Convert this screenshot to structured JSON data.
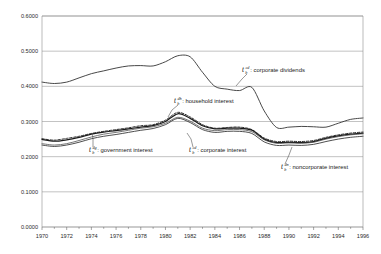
{
  "chart_data": {
    "type": "line",
    "title": "",
    "subtitle": "",
    "xlabel": "",
    "ylabel": "",
    "xlim": [
      1970,
      1996
    ],
    "ylim": [
      0.0,
      0.6
    ],
    "grid": true,
    "grid_axis": "y",
    "legend": "inline-annotations",
    "legend_position": "inside-plot",
    "x": [
      1970,
      1971,
      1972,
      1973,
      1974,
      1975,
      1976,
      1977,
      1978,
      1979,
      1980,
      1981,
      1982,
      1983,
      1984,
      1985,
      1986,
      1987,
      1988,
      1989,
      1990,
      1991,
      1992,
      1993,
      1994,
      1995,
      1996
    ],
    "y_ticks": [
      0.0,
      0.1,
      0.2,
      0.3,
      0.4,
      0.5,
      0.6
    ],
    "y_tick_labels": [
      "0.0000",
      "0.1000",
      "0.2000",
      "0.3000",
      "0.4000",
      "0.5000",
      "0.6000"
    ],
    "x_ticks": [
      1970,
      1972,
      1974,
      1976,
      1978,
      1980,
      1982,
      1984,
      1986,
      1988,
      1990,
      1992,
      1994,
      1996
    ],
    "x_tick_labels": [
      "1970",
      "1972",
      "1974",
      "1976",
      "1978",
      "1980",
      "1982",
      "1984",
      "1986",
      "1988",
      "1990",
      "1992",
      "1994",
      "1996"
    ],
    "series": [
      {
        "name": "corporate dividends",
        "symbol_base": "t",
        "symbol_sub": "b",
        "symbol_sup": "cd",
        "style": "solid",
        "color": "#333333",
        "width": 0.9,
        "values": [
          0.412,
          0.408,
          0.412,
          0.424,
          0.436,
          0.444,
          0.452,
          0.458,
          0.459,
          0.458,
          0.47,
          0.487,
          0.484,
          0.44,
          0.4,
          0.392,
          0.388,
          0.397,
          0.33,
          0.283,
          0.284,
          0.286,
          0.285,
          0.284,
          0.295,
          0.306,
          0.31
        ]
      },
      {
        "name": "household interest",
        "symbol_base": "t",
        "symbol_sub": "b",
        "symbol_sup": "dh",
        "style": "dashed",
        "color": "#1a1a1a",
        "width": 0.9,
        "values": [
          0.251,
          0.247,
          0.252,
          0.258,
          0.266,
          0.272,
          0.277,
          0.282,
          0.288,
          0.291,
          0.304,
          0.326,
          0.313,
          0.291,
          0.281,
          0.283,
          0.284,
          0.277,
          0.253,
          0.243,
          0.244,
          0.243,
          0.246,
          0.255,
          0.262,
          0.267,
          0.27
        ]
      },
      {
        "name": "corporate interest",
        "symbol_base": "t",
        "symbol_sub": "b",
        "symbol_sup": "cd",
        "style": "solid",
        "color": "#1a1a1a",
        "width": 1.25,
        "values": [
          0.249,
          0.244,
          0.248,
          0.255,
          0.264,
          0.27,
          0.274,
          0.279,
          0.284,
          0.288,
          0.3,
          0.322,
          0.309,
          0.288,
          0.279,
          0.281,
          0.281,
          0.275,
          0.25,
          0.24,
          0.241,
          0.24,
          0.243,
          0.252,
          0.259,
          0.264,
          0.267
        ]
      },
      {
        "name": "government interest",
        "symbol_base": "t",
        "symbol_sub": "b",
        "symbol_sup": "dg",
        "style": "solid",
        "color": "#4a4a4a",
        "width": 0.75,
        "values": [
          0.237,
          0.233,
          0.237,
          0.246,
          0.256,
          0.264,
          0.269,
          0.275,
          0.281,
          0.285,
          0.295,
          0.312,
          0.301,
          0.281,
          0.274,
          0.277,
          0.277,
          0.271,
          0.248,
          0.238,
          0.239,
          0.238,
          0.241,
          0.25,
          0.257,
          0.262,
          0.265
        ]
      },
      {
        "name": "noncorporate interest",
        "symbol_base": "t",
        "symbol_sub": "b",
        "symbol_sup": "dn",
        "style": "solid",
        "color": "#2e2e2e",
        "width": 0.85,
        "values": [
          0.233,
          0.229,
          0.233,
          0.241,
          0.251,
          0.258,
          0.263,
          0.269,
          0.275,
          0.28,
          0.291,
          0.309,
          0.297,
          0.277,
          0.269,
          0.272,
          0.272,
          0.266,
          0.242,
          0.232,
          0.233,
          0.232,
          0.235,
          0.243,
          0.25,
          0.255,
          0.258
        ]
      }
    ],
    "annotations": [
      {
        "id": "corporate-dividends",
        "symbol_base": "t",
        "symbol_sub": "b",
        "symbol_sup": "cd",
        "text": ": corporate dividends",
        "x": 242,
        "y": 72,
        "leader": "M 247 74 L 242 79 L 236 86"
      },
      {
        "id": "household-interest",
        "symbol_base": "t",
        "symbol_sub": "b",
        "symbol_sup": "dh",
        "text": ": household interest",
        "x": 174,
        "y": 103,
        "leader": "M 178 105 L 172 110 L 168 117"
      },
      {
        "id": "government-interest",
        "symbol_base": "t",
        "symbol_sub": "b",
        "symbol_sup": "dg",
        "text": ": government interest",
        "x": 89,
        "y": 152,
        "leader": "M 93 147 L 93 139 L 92 133"
      },
      {
        "id": "corporate-interest",
        "symbol_base": "t",
        "symbol_sub": "b",
        "symbol_sup": "cd",
        "text": ": corporate interest",
        "x": 189,
        "y": 152,
        "leader": "M 193 147 L 191 139 L 187 133"
      },
      {
        "id": "noncorporate-interest",
        "symbol_base": "t",
        "symbol_sub": "b",
        "symbol_sup": "dn",
        "text": ": noncorporate interest",
        "x": 281,
        "y": 169,
        "leader": "M 285 164 L 289 155 L 292 147"
      }
    ],
    "colors": {
      "background": "#ffffff",
      "grid": "#9a9a9a",
      "axis": "#6a6a6a",
      "text": "#1a1a1a"
    },
    "plot_area": {
      "left": 42,
      "top": 16,
      "right": 363,
      "bottom": 227
    }
  }
}
